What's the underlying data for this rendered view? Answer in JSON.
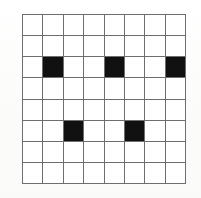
{
  "figure": {
    "type": "grid-pattern",
    "rows": 8,
    "columns": 8,
    "grid_line_color": "#6e6e6e",
    "empty_cell_color": "#ffffff",
    "filled_cell_color": "#111111",
    "background_color": "#fdfdfc",
    "filled_cell_count": 5,
    "filled_cells": [
      {
        "row": 3,
        "column": 2
      },
      {
        "row": 3,
        "column": 5
      },
      {
        "row": 3,
        "column": 8
      },
      {
        "row": 6,
        "column": 3
      },
      {
        "row": 6,
        "column": 6
      }
    ],
    "matrix": [
      [
        0,
        0,
        0,
        0,
        0,
        0,
        0,
        0
      ],
      [
        0,
        0,
        0,
        0,
        0,
        0,
        0,
        0
      ],
      [
        0,
        1,
        0,
        0,
        1,
        0,
        0,
        1
      ],
      [
        0,
        0,
        0,
        0,
        0,
        0,
        0,
        0
      ],
      [
        0,
        0,
        0,
        0,
        0,
        0,
        0,
        0
      ],
      [
        0,
        0,
        1,
        0,
        0,
        1,
        0,
        0
      ],
      [
        0,
        0,
        0,
        0,
        0,
        0,
        0,
        0
      ],
      [
        0,
        0,
        0,
        0,
        0,
        0,
        0,
        0
      ]
    ]
  }
}
